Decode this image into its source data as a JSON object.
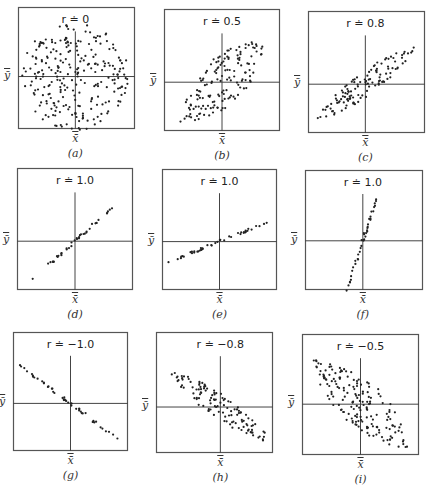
{
  "figure": {
    "x_axis_label": "x̄",
    "y_axis_label": "ȳ"
  },
  "chart_data": [
    {
      "id": "a",
      "type": "scatter",
      "title": "r ≐ 0",
      "r": 0,
      "caption": "(a)",
      "shape": "circle",
      "angle_deg": 0,
      "major": 0.46,
      "minor": 0.46,
      "points": 260,
      "box": {
        "x": 18,
        "y": 7,
        "w": 117,
        "h": 122
      },
      "center": {
        "x": 0.49,
        "y": 0.57
      }
    },
    {
      "id": "b",
      "type": "scatter",
      "title": "r ≐ 0.5",
      "r": 0.5,
      "caption": "(b)",
      "shape": "lens",
      "angle_deg": 45,
      "major": 0.52,
      "minor": 0.2,
      "points": 150,
      "box": {
        "x": 164,
        "y": 9,
        "w": 116,
        "h": 122
      },
      "center": {
        "x": 0.5,
        "y": 0.6
      }
    },
    {
      "id": "c",
      "type": "scatter",
      "title": "r ≐ 0.8",
      "r": 0.8,
      "caption": "(c)",
      "shape": "lens",
      "angle_deg": 37,
      "major": 0.56,
      "minor": 0.1,
      "points": 120,
      "box": {
        "x": 308,
        "y": 11,
        "w": 117,
        "h": 122
      },
      "center": {
        "x": 0.49,
        "y": 0.6
      }
    },
    {
      "id": "d",
      "type": "scatter",
      "title": "r ≐ 1.0",
      "r": 1.0,
      "caption": "(d)",
      "shape": "line",
      "angle_deg": 42,
      "major": 0.5,
      "minor": 0.015,
      "points": 40,
      "box": {
        "x": 17,
        "y": 168,
        "w": 116,
        "h": 122
      },
      "center": {
        "x": 0.5,
        "y": 0.6
      }
    },
    {
      "id": "e",
      "type": "scatter",
      "title": "r ≐ 1.0",
      "r": 1.0,
      "caption": "(e)",
      "shape": "line",
      "angle_deg": 22,
      "major": 0.52,
      "minor": 0.012,
      "points": 44,
      "box": {
        "x": 162,
        "y": 169,
        "w": 115,
        "h": 121
      },
      "center": {
        "x": 0.5,
        "y": 0.6
      }
    },
    {
      "id": "f",
      "type": "scatter",
      "title": "r ≐ 1.0",
      "r": 1.0,
      "caption": "(f)",
      "shape": "line",
      "angle_deg": 72,
      "major": 0.46,
      "minor": 0.012,
      "points": 40,
      "box": {
        "x": 305,
        "y": 170,
        "w": 118,
        "h": 120
      },
      "center": {
        "x": 0.49,
        "y": 0.59
      }
    },
    {
      "id": "g",
      "type": "scatter",
      "title": "r ≐ −1.0",
      "r": -1.0,
      "caption": "(g)",
      "shape": "line",
      "angle_deg": -37,
      "major": 0.56,
      "minor": 0.015,
      "points": 48,
      "box": {
        "x": 13,
        "y": 332,
        "w": 115,
        "h": 119
      },
      "center": {
        "x": 0.5,
        "y": 0.6
      }
    },
    {
      "id": "h",
      "type": "scatter",
      "title": "r ≐ −0.8",
      "r": -0.8,
      "caption": "(h)",
      "shape": "lens",
      "angle_deg": -35,
      "major": 0.56,
      "minor": 0.1,
      "points": 120,
      "box": {
        "x": 156,
        "y": 332,
        "w": 117,
        "h": 121
      },
      "center": {
        "x": 0.55,
        "y": 0.62
      }
    },
    {
      "id": "i",
      "type": "scatter",
      "title": "r ≐ −0.5",
      "r": -0.5,
      "caption": "(i)",
      "shape": "lens",
      "angle_deg": -43,
      "major": 0.56,
      "minor": 0.2,
      "points": 170,
      "box": {
        "x": 302,
        "y": 334,
        "w": 117,
        "h": 121
      },
      "center": {
        "x": 0.5,
        "y": 0.58
      }
    }
  ]
}
